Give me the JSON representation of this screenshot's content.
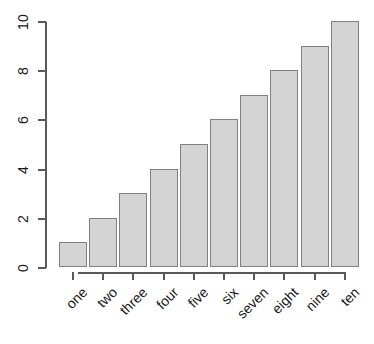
{
  "chart_data": {
    "type": "bar",
    "title": "",
    "subtitle": "",
    "xlabel": "",
    "ylabel": "",
    "categories": [
      "one",
      "two",
      "three",
      "four",
      "five",
      "six",
      "seven",
      "eight",
      "nine",
      "ten"
    ],
    "values": [
      1,
      2,
      3,
      4,
      5,
      6,
      7,
      8,
      9,
      10
    ],
    "ylim": [
      0,
      10
    ],
    "y_ticks": [
      0,
      2,
      4,
      6,
      8,
      10
    ],
    "y_tick_labels": [
      "0",
      "2",
      "4",
      "6",
      "8",
      "10"
    ],
    "x_tick_labels": [
      "one",
      "two",
      "three",
      "four",
      "five",
      "six",
      "seven",
      "eight",
      "nine",
      "ten"
    ],
    "grid": false,
    "legend": null,
    "legend_position": "none",
    "bar_fill_color": "#d4d4d4",
    "bar_border_color": "#808080",
    "axis_color": "#595959",
    "text_color": "#1a1a1a",
    "background_color": "#ffffff",
    "y_tick_label_rotation": -90,
    "x_tick_label_rotation": -45
  }
}
